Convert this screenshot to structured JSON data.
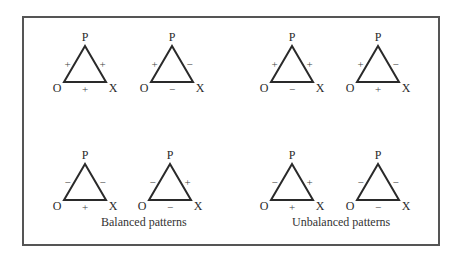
{
  "diagram": {
    "vertex_labels": {
      "top": "P",
      "left": "O",
      "right": "X"
    },
    "groups": [
      {
        "label": "Balanced patterns"
      },
      {
        "label": "Unbalanced patterns"
      }
    ],
    "triangles": [
      {
        "group": "balanced",
        "row": 1,
        "col": 1,
        "cx": 85,
        "top": 46,
        "base": 82,
        "half": 21,
        "signs": {
          "OP": "+",
          "PX": "+",
          "OX": "+"
        }
      },
      {
        "group": "balanced",
        "row": 1,
        "col": 2,
        "cx": 172,
        "top": 46,
        "base": 82,
        "half": 21,
        "signs": {
          "OP": "+",
          "PX": "−",
          "OX": "−"
        }
      },
      {
        "group": "unbalanced",
        "row": 1,
        "col": 3,
        "cx": 292,
        "top": 46,
        "base": 82,
        "half": 21,
        "signs": {
          "OP": "+",
          "PX": "+",
          "OX": "−"
        }
      },
      {
        "group": "unbalanced",
        "row": 1,
        "col": 4,
        "cx": 378,
        "top": 46,
        "base": 82,
        "half": 21,
        "signs": {
          "OP": "+",
          "PX": "−",
          "OX": "+"
        }
      },
      {
        "group": "balanced",
        "row": 2,
        "col": 1,
        "cx": 85,
        "top": 164,
        "base": 200,
        "half": 21,
        "signs": {
          "OP": "−",
          "PX": "−",
          "OX": "+"
        }
      },
      {
        "group": "balanced",
        "row": 2,
        "col": 2,
        "cx": 170,
        "top": 164,
        "base": 200,
        "half": 21,
        "signs": {
          "OP": "−",
          "PX": "+",
          "OX": "−"
        }
      },
      {
        "group": "unbalanced",
        "row": 2,
        "col": 3,
        "cx": 292,
        "top": 164,
        "base": 200,
        "half": 21,
        "signs": {
          "OP": "−",
          "PX": "+",
          "OX": "+"
        }
      },
      {
        "group": "unbalanced",
        "row": 2,
        "col": 4,
        "cx": 378,
        "top": 164,
        "base": 200,
        "half": 21,
        "signs": {
          "OP": "−",
          "PX": "−",
          "OX": "−"
        }
      }
    ],
    "colors": {
      "line": "#2a2a2a",
      "frame": "#555555",
      "text": "#2a2a2a"
    }
  }
}
